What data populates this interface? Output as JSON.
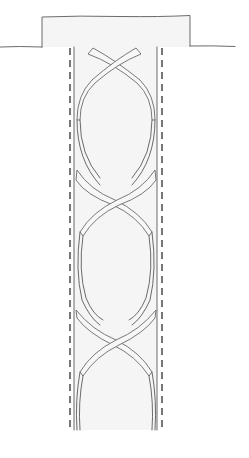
{
  "figure": {
    "title": "",
    "colors": {
      "line": "#5a5a5a",
      "dashed_line": "#2e2e2e",
      "fill": "#f5f5f5",
      "background": "#ffffff"
    },
    "components": {
      "cap": {
        "x": 42,
        "y": 16,
        "width": 148,
        "height": 31
      },
      "ground_line": {
        "y": 47,
        "x_start": 0,
        "x_end": 235
      },
      "shaft": {
        "x_left": 74,
        "x_right": 157,
        "y_top": 47,
        "y_bottom": 430
      },
      "dashed_left": {
        "x": 70,
        "y_top": 47,
        "y_bottom": 430
      },
      "dashed_right": {
        "x": 162,
        "y_top": 47,
        "y_bottom": 430
      },
      "helix_crossings_y": [
        60,
        200,
        338
      ]
    }
  }
}
